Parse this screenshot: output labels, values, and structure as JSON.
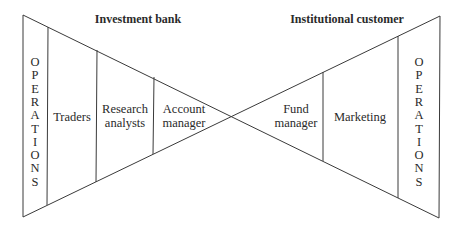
{
  "headings": {
    "left": "Investment bank",
    "right": "Institutional customer"
  },
  "left_side": {
    "operations": [
      "O",
      "P",
      "E",
      "R",
      "A",
      "T",
      "I",
      "O",
      "N",
      "S"
    ],
    "segments": [
      {
        "lines": [
          "Traders"
        ]
      },
      {
        "lines": [
          "Research",
          "analysts"
        ]
      },
      {
        "lines": [
          "Account",
          "manager"
        ]
      }
    ]
  },
  "right_side": {
    "segments": [
      {
        "lines": [
          "Fund",
          "manager"
        ]
      },
      {
        "lines": [
          "Marketing"
        ]
      }
    ],
    "operations": [
      "O",
      "P",
      "E",
      "R",
      "A",
      "T",
      "I",
      "O",
      "N",
      "S"
    ]
  },
  "colors": {
    "line": "#3a3a3a",
    "text": "#2a2a2a",
    "background": "#ffffff"
  }
}
